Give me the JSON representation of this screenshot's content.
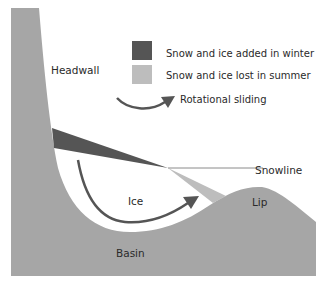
{
  "diagram": {
    "type": "cirque-glacier cross-section",
    "colors": {
      "bedrock": "#a6a6a6",
      "accumulation": "#555555",
      "ablation": "#bdbdbd",
      "arrow": "#555555",
      "snowline": "#8a8a8a",
      "text": "#2a2a2a",
      "background": "#ffffff"
    },
    "labels": {
      "headwall": "Headwall",
      "snowline": "Snowline",
      "ice": "Ice",
      "lip": "Lip",
      "basin": "Basin"
    },
    "legend": [
      {
        "label": "Snow and ice added in winter",
        "swatch": "accumulation"
      },
      {
        "label": "Snow and ice lost in summer",
        "swatch": "ablation"
      },
      {
        "label": "Rotational sliding",
        "swatch": "arrow"
      }
    ]
  }
}
